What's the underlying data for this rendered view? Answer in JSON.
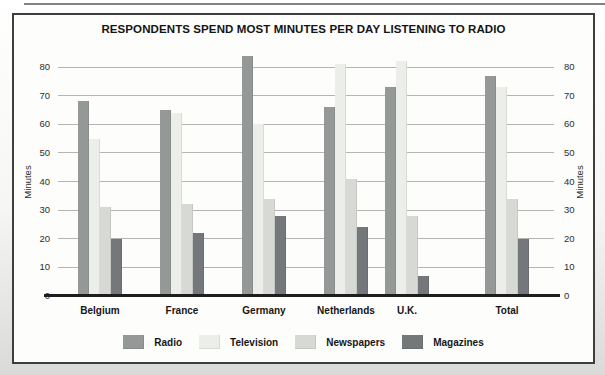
{
  "chart_data": {
    "type": "bar",
    "title": "RESPONDENTS SPEND MOST MINUTES PER DAY LISTENING TO RADIO",
    "categories": [
      "Belgium",
      "France",
      "Germany",
      "Netherlands",
      "U.K.",
      "Total"
    ],
    "series": [
      {
        "name": "Radio",
        "color": "#949897",
        "values": [
          68,
          65,
          84,
          66,
          73,
          77
        ]
      },
      {
        "name": "Television",
        "color": "#eceee9",
        "values": [
          55,
          64,
          60,
          81,
          82,
          73
        ]
      },
      {
        "name": "Newspapers",
        "color": "#d7d9d4",
        "values": [
          31,
          32,
          34,
          41,
          28,
          34
        ]
      },
      {
        "name": "Magazines",
        "color": "#75787a",
        "values": [
          20,
          22,
          28,
          24,
          7,
          20
        ]
      }
    ],
    "ylabel_left": "Minutes",
    "ylabel_right": "Minutes",
    "y_ticks": [
      0,
      10,
      20,
      30,
      40,
      50,
      60,
      70,
      80
    ],
    "ylim": [
      0,
      80
    ],
    "grid": true,
    "legend_position": "bottom",
    "frame_color": "#3e3e3c",
    "gridline_color": "#b4b4b2",
    "baseline_color": "#1e1e1e"
  }
}
